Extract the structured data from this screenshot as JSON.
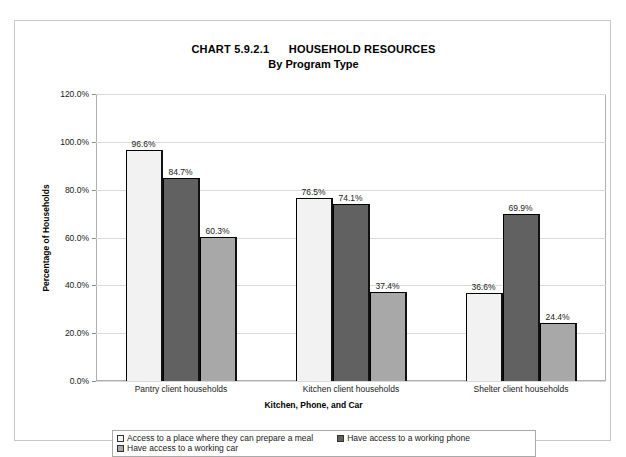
{
  "chart_data": {
    "type": "bar",
    "title": "CHART 5.9.2.1      HOUSEHOLD RESOURCES",
    "subtitle": "By Program Type",
    "xlabel": "Kitchen, Phone, and Car",
    "ylabel": "Percentage of Households",
    "ylim": [
      0,
      120
    ],
    "ytick_labels": [
      "0.0%",
      "20.0%",
      "40.0%",
      "60.0%",
      "80.0%",
      "100.0%",
      "120.0%"
    ],
    "ytick_values": [
      0,
      20,
      40,
      60,
      80,
      100,
      120
    ],
    "grid": true,
    "legend_position": "bottom",
    "categories": [
      "Pantry client households",
      "Kitchen client households",
      "Shelter client households"
    ],
    "series": [
      {
        "name": "Access to a place where they can prepare a meal",
        "color": "#f2f2f2",
        "values": [
          96.6,
          76.5,
          36.6
        ],
        "labels": [
          "96.6%",
          "76.5%",
          "36.6%"
        ]
      },
      {
        "name": "Have access to a working phone",
        "color": "#616161",
        "values": [
          84.7,
          74.1,
          69.9
        ],
        "labels": [
          "84.7%",
          "74.1%",
          "69.9%"
        ]
      },
      {
        "name": "Have access to a working car",
        "color": "#a8a8a8",
        "values": [
          60.3,
          37.4,
          24.4
        ],
        "labels": [
          "60.3%",
          "37.4%",
          "24.4%"
        ]
      }
    ]
  },
  "legend": {
    "items": [
      "Access to a place where they can prepare a meal",
      "Have access to a working phone",
      "Have access to a working car"
    ]
  }
}
